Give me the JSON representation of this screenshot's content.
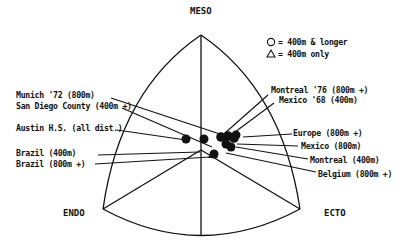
{
  "diagram": {
    "type": "somatochart",
    "poles": {
      "top": "MESO",
      "left": "ENDO",
      "right": "ECTO"
    },
    "legend": {
      "circle": "= 400m & longer",
      "triangle": "= 400m only"
    },
    "labels_left": [
      "Munich '72 (800m)",
      "San Diego County (400m +)",
      "Austin H.S. (all dist.)",
      "Brazil (400m)",
      "Brazil (800m +)"
    ],
    "labels_right": [
      "Montreal '76 (800m +)",
      "Mexico '68 (400m)",
      "Europe (800m +)",
      "Mexico (800m)",
      "Montreal (400m)",
      "Belgium (800m +)"
    ],
    "colors": {
      "ink": "#111111",
      "background": "#ffffff"
    }
  }
}
